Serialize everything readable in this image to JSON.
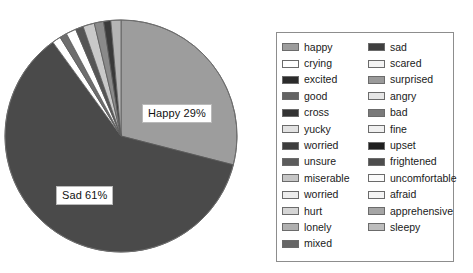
{
  "chart_data": {
    "type": "pie",
    "title": "",
    "labels": [
      "Happy",
      "Sad",
      "sliver-1",
      "sliver-2",
      "sliver-3",
      "sliver-4",
      "sliver-5",
      "sliver-6",
      "sliver-7",
      "sliver-8"
    ],
    "values": [
      29,
      61,
      1.2,
      1.0,
      1.4,
      1.1,
      1.6,
      1.3,
      1.0,
      1.4
    ],
    "displayed_labels": [
      {
        "text": "Happy 29%",
        "value": 29,
        "slice": "Happy"
      },
      {
        "text": "Sad 61%",
        "value": 61,
        "slice": "Sad"
      }
    ],
    "colors": [
      "#9d9d9d",
      "#4a4a4a",
      "#ffffff",
      "#6e6e6e",
      "#ffffff",
      "#555555",
      "#c9c9c9",
      "#8a8a8a",
      "#3a3a3a",
      "#b5b5b5"
    ],
    "legend_position": "right",
    "grid": false,
    "xlabel": "",
    "ylabel": ""
  },
  "pie": {
    "happy_label": "Happy 29%",
    "sad_label": "Sad 61%"
  },
  "legend": {
    "columns": [
      {
        "items": [
          {
            "label": "happy",
            "color": "#9d9d9d"
          },
          {
            "label": "crying",
            "color": "#ffffff"
          },
          {
            "label": "excited",
            "color": "#2b2b2b"
          },
          {
            "label": "good",
            "color": "#636363"
          },
          {
            "label": "cross",
            "color": "#333333"
          },
          {
            "label": "yucky",
            "color": "#e2e2e2"
          },
          {
            "label": "worried",
            "color": "#3d3d3d"
          },
          {
            "label": "unsure",
            "color": "#5c5c5c"
          },
          {
            "label": "miserable",
            "color": "#c6c6c6"
          },
          {
            "label": "worried",
            "color": "#ededed"
          },
          {
            "label": "hurt",
            "color": "#d5d5d5"
          },
          {
            "label": "lonely",
            "color": "#b0b0b0"
          },
          {
            "label": "mixed",
            "color": "#666666"
          }
        ]
      },
      {
        "items": [
          {
            "label": "sad",
            "color": "#3f3f3f"
          },
          {
            "label": "scared",
            "color": "#f3f3f3"
          },
          {
            "label": "surprised",
            "color": "#9a9a9a"
          },
          {
            "label": "angry",
            "color": "#e6e6e6"
          },
          {
            "label": "bad",
            "color": "#7a7a7a"
          },
          {
            "label": "fine",
            "color": "#f0f0f0"
          },
          {
            "label": "upset",
            "color": "#1f1f1f"
          },
          {
            "label": "frightened",
            "color": "#4d4d4d"
          },
          {
            "label": "uncomfortable",
            "color": "#fbfbfb"
          },
          {
            "label": "afraid",
            "color": "#f5f5f5"
          },
          {
            "label": "apprehensive",
            "color": "#a5a5a5"
          },
          {
            "label": "sleepy",
            "color": "#bdbdbd"
          }
        ]
      }
    ]
  }
}
